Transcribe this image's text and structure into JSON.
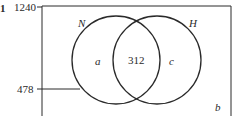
{
  "diagram": {
    "type": "venn",
    "marker_left": "1",
    "rect_label_top": "1240",
    "rect_label_side": "478",
    "sets": [
      {
        "name": "N",
        "only_region": "a"
      },
      {
        "name": "H",
        "only_region": "c"
      }
    ],
    "intersection": "312",
    "outside": "b"
  }
}
